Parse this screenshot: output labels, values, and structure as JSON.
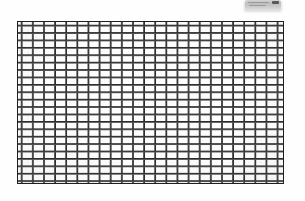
{
  "image": {
    "kind": "scanned-photograph",
    "subject": "rectangular wire-mesh grid",
    "width_px": 305,
    "height_px": 201,
    "background_color": "#ffffff",
    "paper_color": "#fefefe"
  },
  "grid": {
    "label": "mesh-grid",
    "left_px": 17,
    "top_px": 21,
    "width_px": 267,
    "height_px": 163,
    "columns": 24,
    "rows": 22,
    "cell_width_px": 11.1,
    "cell_height_px": 7.4,
    "line_color": "#2a2a2a",
    "line_halo_color": "#8c8c8c",
    "line_thickness_px": 1.6,
    "border_color": "#1f1f1f",
    "border_thickness_px": 1.6,
    "cell_fill_color": "#fdfdfd"
  },
  "artifact": {
    "label": "corner-smudge",
    "left_px": 245,
    "top_px": 0,
    "width_px": 36,
    "height_px": 9,
    "body_color": "#c5c5c5",
    "chip_color": "#4b4b4b",
    "streak_color": "#9a9a9a"
  }
}
